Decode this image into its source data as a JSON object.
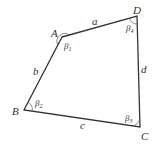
{
  "diagram": {
    "type": "quadrilateral",
    "stroke_color": "#333333",
    "vertices": [
      {
        "id": "A",
        "label": "A",
        "x": 62,
        "y": 37
      },
      {
        "id": "D",
        "label": "D",
        "x": 137,
        "y": 16
      },
      {
        "id": "C",
        "label": "C",
        "x": 140,
        "y": 127
      },
      {
        "id": "B",
        "label": "B",
        "x": 24,
        "y": 110
      }
    ],
    "sides": [
      {
        "label": "a",
        "from": "A",
        "to": "D"
      },
      {
        "label": "b",
        "from": "A",
        "to": "B"
      },
      {
        "label": "c",
        "from": "B",
        "to": "C"
      },
      {
        "label": "d",
        "from": "D",
        "to": "C"
      }
    ],
    "angles": [
      {
        "vertex": "A",
        "symbol": "β",
        "sub": "1"
      },
      {
        "vertex": "B",
        "symbol": "β",
        "sub": "2"
      },
      {
        "vertex": "C",
        "symbol": "β",
        "sub": "3"
      },
      {
        "vertex": "D",
        "symbol": "β",
        "sub": "4"
      }
    ]
  }
}
